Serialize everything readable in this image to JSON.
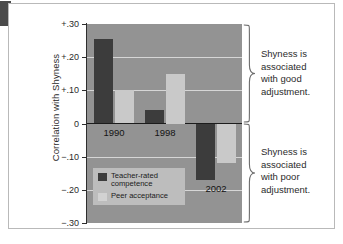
{
  "figure": {
    "corner_tab": "figure-marker"
  },
  "chart_data": {
    "type": "bar",
    "title": "",
    "xlabel": "",
    "ylabel": "Correlation with Shyness",
    "categories": [
      "1990",
      "1998",
      "2002"
    ],
    "series": [
      {
        "name": "Teacher-rated competence",
        "values": [
          0.255,
          0.04,
          -0.17
        ]
      },
      {
        "name": "Peer acceptance",
        "values": [
          0.1,
          0.15,
          -0.12
        ]
      }
    ],
    "ylim": [
      -0.3,
      0.3
    ],
    "ytick_values": [
      0.3,
      0.2,
      0.1,
      0,
      -0.1,
      -0.2,
      -0.3
    ],
    "ytick_labels": [
      "+.30",
      "+.20",
      "+.10",
      "0",
      "−.10",
      "−.20",
      "−.30"
    ],
    "grid": true,
    "legend_position": "inside-bottom-left",
    "annotations": [
      "Shyness is associated with good adjustment.",
      "Shyness is associated with poor adjustment."
    ]
  },
  "axis": {
    "y_title": "Correlation with Shyness",
    "ticks": [
      {
        "label": "+.30",
        "value": 0.3
      },
      {
        "label": "+.20",
        "value": 0.2
      },
      {
        "label": "+.10",
        "value": 0.1
      },
      {
        "label": "0",
        "value": 0
      },
      {
        "label": "−.10",
        "value": -0.1
      },
      {
        "label": "−.20",
        "value": -0.2
      },
      {
        "label": "−.30",
        "value": -0.3
      }
    ]
  },
  "groups": [
    {
      "label": "1990",
      "teacher": 0.255,
      "peer": 0.1
    },
    {
      "label": "1998",
      "teacher": 0.04,
      "peer": 0.15
    },
    {
      "label": "2002",
      "teacher": -0.17,
      "peer": -0.12
    }
  ],
  "legend": {
    "items": [
      {
        "swatch": "dark",
        "line1": "Teacher-rated",
        "line2": "competence"
      },
      {
        "swatch": "light",
        "line1": "Peer acceptance",
        "line2": ""
      }
    ]
  },
  "annotations": {
    "top": {
      "line1": "Shyness is",
      "line2": "associated",
      "line3": "with good",
      "line4": "adjustment."
    },
    "bottom": {
      "line1": "Shyness is",
      "line2": "associated",
      "line3": "with poor",
      "line4": "adjustment."
    }
  },
  "colors": {
    "teacher_bar": "#3c3c3c",
    "peer_bar": "#c9c9c9",
    "plot_background": "#939393",
    "gridline": "#d6d6d6",
    "zero_line": "#1c1c1c",
    "legend_background": "#bdbdbd",
    "text": "#2b2b2b"
  }
}
